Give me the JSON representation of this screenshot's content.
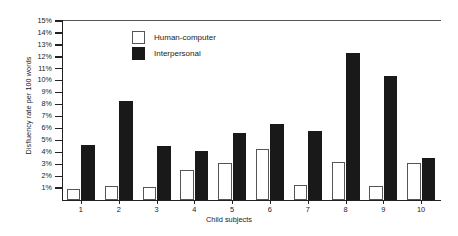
{
  "chart_data": {
    "type": "bar",
    "title": "",
    "xlabel": "Child subjects",
    "ylabel": "Disfluency rate per 100 words",
    "categories": [
      "1",
      "2",
      "3",
      "4",
      "5",
      "6",
      "7",
      "8",
      "9",
      "10"
    ],
    "ylim": [
      0,
      15
    ],
    "ytick_labels": [
      "1%",
      "2%",
      "3%",
      "4%",
      "5%",
      "6%",
      "7%",
      "8%",
      "9%",
      "10%",
      "11%",
      "12%",
      "13%",
      "14%",
      "15%"
    ],
    "ytick_values": [
      1,
      2,
      3,
      4,
      5,
      6,
      7,
      8,
      9,
      10,
      11,
      12,
      13,
      14,
      15
    ],
    "grid": false,
    "legend_position": "top-left-inside",
    "series": [
      {
        "name": "Human-computer",
        "color": "#ffffff",
        "edge_color": "#555555",
        "values": [
          0.9,
          1.2,
          1.1,
          2.5,
          3.1,
          4.3,
          1.3,
          3.2,
          1.2,
          3.1
        ]
      },
      {
        "name": "Interpersonal",
        "color": "#191919",
        "edge_color": "#191919",
        "values": [
          4.6,
          8.3,
          4.5,
          4.1,
          5.6,
          6.4,
          5.8,
          12.3,
          10.4,
          3.5
        ]
      }
    ]
  },
  "legend": {
    "items": [
      {
        "label": "Human-computer",
        "swatch": "hollow-square"
      },
      {
        "label": "Interpersonal",
        "swatch": "filled-square"
      }
    ]
  },
  "axes": {
    "y_title": "Disfluency rate per 100 words",
    "x_title": "Child subjects"
  }
}
